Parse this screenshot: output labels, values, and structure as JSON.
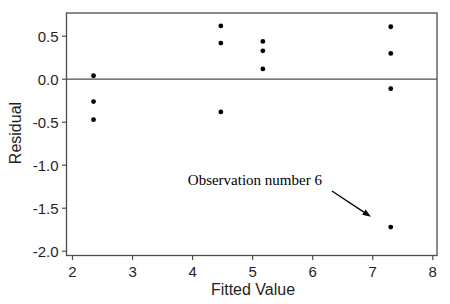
{
  "figure": {
    "kind": "residual-scatter-plot",
    "background": "#ffffff"
  },
  "colors": {
    "frame": "#4d4d4d",
    "marker": "#000000",
    "text": "#1f1f1f",
    "annotation": "#000000",
    "background": "#ffffff"
  },
  "chart_data": {
    "type": "scatter",
    "title": "",
    "xlabel": "Fitted Value",
    "ylabel": "Residual",
    "xlim": [
      1.9,
      8.07
    ],
    "ylim": [
      -2.05,
      0.77
    ],
    "xticks": [
      2,
      3,
      4,
      5,
      6,
      7,
      8
    ],
    "xtick_labels": [
      "2",
      "3",
      "4",
      "5",
      "6",
      "7",
      "8"
    ],
    "yticks": [
      0.5,
      0.0,
      -0.5,
      -1.0,
      -1.5,
      -2.0
    ],
    "ytick_labels": [
      "0.5",
      "0.0",
      "-0.5",
      "-1.0",
      "-1.5",
      "-2.0"
    ],
    "grid": false,
    "legend": "none",
    "reference_line_y": 0.0,
    "marker_radius": 2.4,
    "points": [
      {
        "x": 2.35,
        "y": 0.04
      },
      {
        "x": 2.35,
        "y": -0.26
      },
      {
        "x": 2.35,
        "y": -0.47
      },
      {
        "x": 4.47,
        "y": 0.62
      },
      {
        "x": 4.47,
        "y": 0.42
      },
      {
        "x": 4.47,
        "y": -0.38
      },
      {
        "x": 5.17,
        "y": 0.44
      },
      {
        "x": 5.17,
        "y": 0.33
      },
      {
        "x": 5.17,
        "y": 0.12
      },
      {
        "x": 7.3,
        "y": 0.61
      },
      {
        "x": 7.3,
        "y": 0.3
      },
      {
        "x": 7.3,
        "y": -0.11
      },
      {
        "x": 7.3,
        "y": -1.72
      }
    ],
    "annotation": {
      "text": "Observation number 6",
      "text_x": 3.92,
      "text_y": -1.23,
      "arrow_from": {
        "x": 6.32,
        "y": -1.3
      },
      "arrow_to": {
        "x": 6.97,
        "y": -1.6
      },
      "points_to_observation": {
        "x": 7.3,
        "y": -1.72
      }
    }
  }
}
